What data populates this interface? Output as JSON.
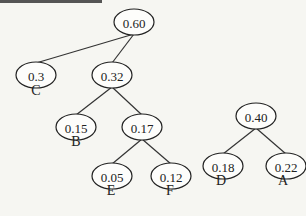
{
  "diagram": {
    "type": "huffman-trees",
    "nodes": [
      {
        "id": "n060",
        "value": "0.60",
        "x": 134,
        "y": 22
      },
      {
        "id": "n03",
        "value": "0.3",
        "x": 36,
        "y": 75
      },
      {
        "id": "n032",
        "value": "0.32",
        "x": 112,
        "y": 75
      },
      {
        "id": "n015",
        "value": "0.15",
        "x": 76,
        "y": 127
      },
      {
        "id": "n017",
        "value": "0.17",
        "x": 142,
        "y": 127
      },
      {
        "id": "n005",
        "value": "0.05",
        "x": 112,
        "y": 176
      },
      {
        "id": "n012",
        "value": "0.12",
        "x": 171,
        "y": 176
      },
      {
        "id": "n040",
        "value": "0.40",
        "x": 256,
        "y": 116
      },
      {
        "id": "n018",
        "value": "0.18",
        "x": 223,
        "y": 166
      },
      {
        "id": "n022",
        "value": "0.22",
        "x": 286,
        "y": 166
      }
    ],
    "edges": [
      [
        "n060",
        "n03"
      ],
      [
        "n060",
        "n032"
      ],
      [
        "n032",
        "n015"
      ],
      [
        "n032",
        "n017"
      ],
      [
        "n017",
        "n005"
      ],
      [
        "n017",
        "n012"
      ],
      [
        "n040",
        "n018"
      ],
      [
        "n040",
        "n022"
      ]
    ],
    "leaf_labels": [
      {
        "node": "n03",
        "label": "C",
        "x": 36,
        "y": 92
      },
      {
        "node": "n015",
        "label": "B",
        "x": 76,
        "y": 143
      },
      {
        "node": "n005",
        "label": "E",
        "x": 111,
        "y": 192
      },
      {
        "node": "n012",
        "label": "F",
        "x": 170,
        "y": 192
      },
      {
        "node": "n018",
        "label": "D",
        "x": 221,
        "y": 182
      },
      {
        "node": "n022",
        "label": "A",
        "x": 283,
        "y": 182
      }
    ]
  }
}
